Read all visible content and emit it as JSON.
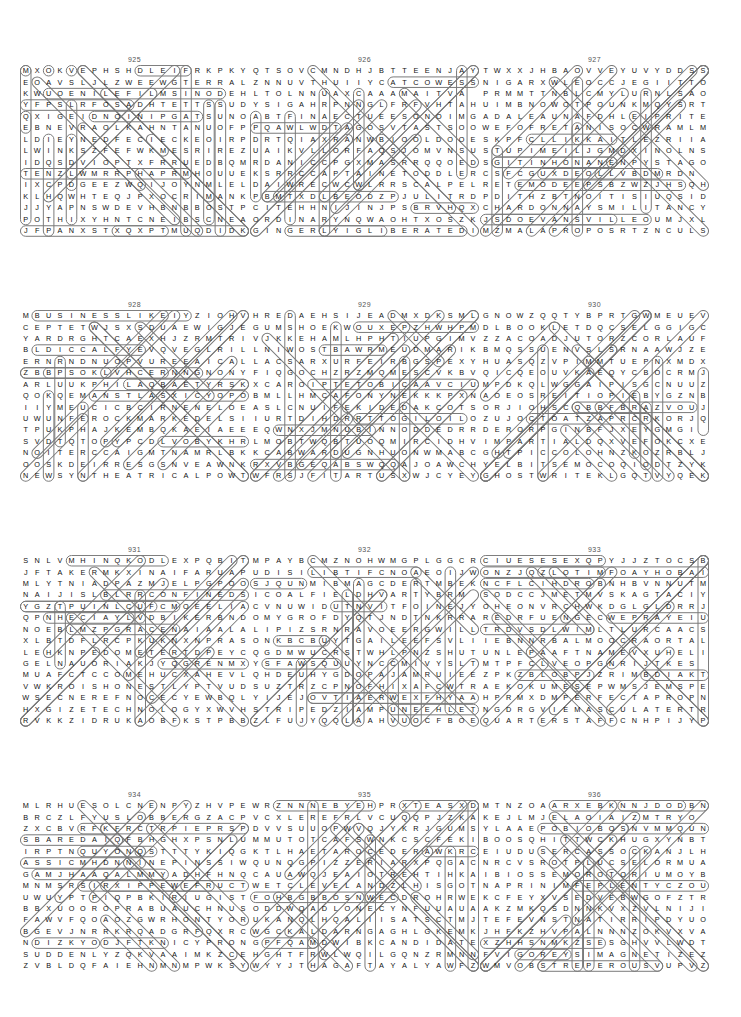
{
  "page": {
    "background_color": "#ffffff",
    "letter_color": "#111111",
    "mark_color": "#7a7a7a",
    "number_color": "#555555",
    "columns": 3,
    "rows": 4,
    "grid_size": 18
  },
  "puzzles": [
    {
      "number": "925",
      "grid": [
        "MXOKVEPHSHDLEIFRKPKY",
        "EOAVSLJLZWEEWGTERRAL",
        "KWUOENILEFILMSINODEH",
        "YFPSLRFOSADHTETTSSUD",
        "QXIGEIDNOINIPGATSUNO",
        "EBNEVRAOLKAHNTANUOFP",
        "LDIEYNEDFECIECKEOIRP",
        "LWINKSZFEFWKMESRIREZ",
        "IDQSDVIOPTXFRRUEDBQM",
        "TENZLWMRRPHAPRMHOUUE",
        "IXCPDGEEZWQIJOYNMLEL",
        "KLHQWHTEQJPXOCRIMANK",
        "JJYAPNSWDEVHBNBBOSTP",
        "POTHIXYHNTCNEIBSCNEA",
        "JFPANXSTXQXPTMUQDIDK"
      ],
      "solution_words": [
        "FILMS",
        "DIE",
        "FOUNTAIN",
        "CAPTION",
        "PINION",
        "CRIMINAL",
        "ODE"
      ]
    },
    {
      "number": "926",
      "grid": [
        "QTSOVCMNDHJBTTEENJAY",
        "ZNNUVTHUIIYCATCOWESS",
        "LTOLNNUAXCAAAMAITVA",
        "YSIGAHRPNNGLFRFVHTAH",
        "ABTFINAECTUEESONOIMG",
        "PQAWLWDTAGOSVTASTSOO",
        "DRTQIAXRANWBIOOLDOOE",
        "UAIKVLLORFAQSJOMVNSU",
        "RDANICCPGXMASRRQQOED",
        "KSRRCCAPTAINETODDLER",
        "DAIWRECWCWLRRSCALPEL",
        "PBMTXDLBEODZPJULITRD",
        "CITEHHNIJINJPSBRVHQX",
        "ORDINARYNQWAOHTXOSZK",
        "GINGERLYIGLIBERATEDI"
      ],
      "solution_words": [
        "CAPTAIN",
        "TODDLER",
        "SCALPEL",
        "ORDINARY",
        "GINGERLY",
        "LIBERATED",
        "TEEN"
      ]
    },
    {
      "number": "927",
      "grid": [
        "TWXXJHBAOVVEYUVYDDSS",
        "NIGARXWLEOCCJEGIITTO",
        "PRMMTTNBLCMYLURNLSAON",
        "UIMBNOWOTPOUNKMQYSRTE",
        "ADALEAUNAFDHLEIPRITEM",
        "WEFOFRETANISOCWRAMLMA",
        "SKPFCLLIKKAITLEZRIIAS",
        "STUPIMEILJGMDXINOLNSO",
        "SGITINHONANENPYSTAGOK",
        "CSFCGUXDEOLLVBDMRDN",
        "RETEMODEEPSBZWZJHSQH",
        "PDITHZBTNOITISIUQSID",
        "CHARDONNAYSMILITANCY",
        "JSDOEVANSVILLEOUMJXL",
        "MZMALAPROPOSRTZNCULS"
      ],
      "solution_words": [
        "SPEEDOMETER",
        "DISQUISITION",
        "CHARDONNAY",
        "MILITANCY",
        "EVANSVILLE",
        "MALAPROPOS"
      ]
    },
    {
      "number": "928",
      "grid": [
        "MBUSINESSLIKEIYZIOHV",
        "CEPTETWJSXSDUAEWIGJE",
        "YARDRGHTCAEXHJZRMTRI",
        "BLDICCALFYEVQVEGLRIL",
        "ERNRNDNUOPVUREEAICAL",
        "ZBBPSOKLVHCERNNGNONY",
        "ARLUUKPHILAQBAETYRSK",
        "QOKQEMANSTLASXICYOPO",
        "IIYMEUCICBCIRNENELOE",
        "UWUNFEROCKMARKEDELSI",
        "TPUKPHAJKEMBQKAEIAEE",
        "SVDTQTOPYPCDLVOBYKHR",
        "NOITERCCAIGMTNAMRLBK",
        "OOSKDEIRRESGSNVEAWNK",
        "NEWSYNTHEATRICALPOWT"
      ],
      "solution_words": [
        "BUSINESSLIKE",
        "STOCKMARKED",
        "ACCRETION",
        "SERRIED",
        "NEWSY",
        "THEATRICAL",
        "VERILY"
      ]
    },
    {
      "number": "929",
      "grid": [
        "HREDAEHSIJEADMXDKSML",
        "GUMSHOEKWOUXEPZHWHPM",
        "VJKKEHAMLHPHTIUPGIMV",
        "LNIWOSTBAWRMEUDMARIK",
        "LACSARXURFEIRBGSPEXY",
        "FIQGOCHZRZMQMESCVKBV",
        "XCAROIPTETOBICAAVCIU",
        "BMLLHMCAFONYNEKKKPXN",
        "ASLCNUIFEKIDEDAKCOTS",
        "IURTDIHDRRTTOGILOILO",
        "EQWNXJMNUBINNODDEDRR",
        "LMOBTWQBTUOQMIRCIDHV",
        "KCABWARDUGNHUONWMABC",
        "RXVBGEQABSWQQAJOAWCH",
        "WFRSJFITARTUSXWJCYEY"
      ],
      "solution_words": [
        "HEADER",
        "GUMSHOE",
        "RASCAL",
        "BRIEF",
        "STOCKADE",
        "ILOILO",
        "BACKWARD",
        "TARTUS"
      ]
    },
    {
      "number": "930",
      "grid": [
        "GNOWZQQTYBPRTGWMEUEV",
        "DLBOOKLETDQCSELGGIGC",
        "ZZACOADJUTORZCORLAUF",
        "BMQSSUENVSLSRNAAWJZE",
        "HUASQZVPIMMTUEPNXMDX",
        "QICQEOUVKAEQYCBOCRMJ",
        "MPDKQLWGGAIPISGCNUUZ",
        "AOEOSREITIOPIEBYGZNB",
        "ORJIOHSCQBBFBRAZVOUJ",
        "ZUJOCTOATZAPRCRKORJQ",
        "DERORPGINBFJXEYGMGI",
        "IMPARTIALDQXVEFOKCXE",
        "GHTPICCOLOHNZKOZRBLJ",
        "YELBITSEMOCOQIODTZYK",
        "GHOSTWRITEKLGQTVYQEK"
      ],
      "solution_words": [
        "BOOKLET",
        "COADJUTOR",
        "GIGGLE",
        "SUENS",
        "POITIERS",
        "IMPARTIAL",
        "PICCOLO",
        "COMESTIBLEY",
        "GHOSTWRITE"
      ]
    },
    {
      "number": "931",
      "grid": [
        "SNLVMHINQKODLEXPQBIT",
        "JFTAKERMKXINAIFARUAP",
        "MLYTNIADPAZMJELPGPOO",
        "NAIJISLBLRRCONFINEDS",
        "YGZTPUINLCUFCMOEELIA",
        "QPNHECIAYLVDBIKERBND",
        "NOEBLMZPGRACENAIAALA",
        "XLBTDFLRCPKUKNXNPRAS",
        "LEHKNPEDOMETERTDPEYC",
        "GELNAUORIAKJYQGRENMX",
        "MUAFCTCCOMEHUCXAHEVL",
        "VWKROISHONESTLYPTVUD",
        "WSECNEREFNOCECYEWBQL",
        "HXGIZETECHNOLOGYXWVH",
        "RVKKZIDRUKAOBFKSTPBB"
      ],
      "solution_words": [
        "CONFINED",
        "PEDOMETER",
        "ARIOUAN",
        "HONESTLY",
        "CONFERENCE",
        "TECHNOLOGY",
        "BIKER"
      ]
    },
    {
      "number": "932",
      "grid": [
        "MPAYBCMZNOHWMGPLGGCR",
        "UDISILIBTIFCNOAEOIJW",
        "SJQUNMIBMAGCDERTMBEK",
        "ICOALFIELDHVARTYBRM",
        "CVNUWIDUTNVITFOINEJY",
        "OMYGROFDYQTJNDTNKRRA",
        "LIPIZSRNRAVOEERGWILL",
        "ONKBCBUYTGAILEEFSVLI",
        "QGDMWUCRSTWHLPNZSHUT",
        "YSFAWSQUUYNCCMIVYSLT",
        "QHDEUHYGDOPAJAMRUIEE",
        "SUZTRZCPNOFHIXAFCWTR",
        "YIJEJOVTIAERWEXFHYAA",
        "STRIPEDZIAMPUNEEHLET",
        "ZLFUJYQQLAAHVUOCFBOE"
      ],
      "solution_words": [
        "COALFIELD",
        "ISILIBT",
        "STRIPED",
        "PAJAM",
        "GIGGLE"
      ]
    },
    {
      "number": "933",
      "grid": [
        "CIUESESEXQPYJJZTOCSB",
        "ONZJQZLOTIMFOAYHOBAI",
        "NCFLCIHDROBNHBVNNUTM",
        "SODCCJMETMVSKAGTACIY",
        "OHEONVRCHWKDGLGLDRRJ",
        "REDRFUENGECWEPRAYEIU",
        "TRDVSDLWIMLTLURCAACS",
        "IEBNNRBALMOOCRAORTAL",
        "UNLEPAAFTNAMEVXUHELI",
        "MTPFCLVEOPGNRIJTKES",
        "ZPKZBLOBPJZRIMBDIAKT",
        "AEKOKUMESEPWMSJEMSPE",
        "HPRMXDMPERFECTAPROPN",
        "NGDRGVIEMASCULATERTR",
        "QUARTERSTAFFCNHPIJYP"
      ],
      "solution_words": [
        "PERFECTA",
        "EMASCULATER",
        "QUARTERSTAFF",
        "PRAYER",
        "NAME"
      ]
    },
    {
      "number": "934",
      "grid": [
        "MLRHUESOLCNENPYZHVPE",
        "BRCZLFYUSLOBBERGZACP",
        "ZXCBVRFKFRCTRPIEPRSP",
        "SBAREDAIQFBHGHXPSNLU",
        "IRPTNQUYONQSTTTYKIQG",
        "ASSICMHDNNINEPINSSIW",
        "GAMJHAAQALMMYADHFHNQ",
        "MNMSRSIRXIPPEWEFRUCT",
        "UWUYPTPIQPBKIRIUGIST",
        "BBXUOOROPRABUAUCHNUS",
        "FAWVFQOAOZGWRHONTYOR",
        "BGEVJNRRKRQADGRFQXRC",
        "NDIZKYODJFTKNICYPRON",
        "SUDDENLYZQKVAAIMKZCE",
        "ZVBLDQFAIEHNMNMPWKSY"
      ],
      "solution_words": [
        "CLOSE",
        "SLOBBER",
        "NINEPINS",
        "SUDDENLY",
        "IRIGUIS"
      ]
    },
    {
      "number": "935",
      "grid": [
        "WRZNNNEBYEHPRXTEASXD",
        "VCXLEREFRLVCUQQPJZKAE",
        "DVVSUUOPWVQJYKRJGUMS",
        "MMUTOTCAFSWNKCSCFEKI",
        "KTLHAETAROCEDERAWKRC",
        "QUNQGPIZZERIARXPQGAC",
        "CAUAWQJEAIOTREHTIHKA",
        "WETCLEVELANDZLHISGOT",
        "FOHBGBBOSNWECDROHRWE",
        "ODDWQADLONECYNFUUAUA",
        "UKANQLHQALIISATSCTMJ",
        "WGCKALDARNGAGHLGKEMK",
        "GPFQAMDWIBKCANDIDATE",
        "HGHTFRWLWQILGQNZRMNN",
        "WYYJTHAGAFTAYALYAWFZ"
      ],
      "solution_words": [
        "FACTOTUM",
        "REDECORATE",
        "PIZZERIA",
        "THERTO",
        "CLEVELAND",
        "CANDIDATE",
        "WAYLAY"
      ]
    },
    {
      "number": "936",
      "grid": [
        "MTNZOAARXEBKNNJDODBN",
        "KEJLMJELAOIAIZMTRYO",
        "YLAAEPOBIOBOSNVMMQUN",
        "BOOSQHITTWCKHUGXYNBT",
        "EIUDUSERCASSOCKANJLH",
        "NRCVSROTPLUCSELORMUA",
        "IBIOSSEMOROTORIUMOYB",
        "NAPRINIMFEPLENTYCZOU",
        "KCFEYXVSEDVEBWGOFZTR",
        "AKZMKQSDNNKVXZVLNIJI",
        "TEFEVNSTNATIRRIPDYUO",
        "JHFKZHVPALNNNZOKVXVA",
        "XZHHSNMKZSESGHVVLWDT",
        "FVIGOREYSIMAGNETIZEZ",
        "WMVOBSTREPEROUSVUPVZ"
      ],
      "solution_words": [
        "CASSOCK",
        "SCULPTOR",
        "MORATORIUM",
        "PLENTY",
        "IRRITANT",
        "VIGOR",
        "MAGNETIZE",
        "OBSTREPEROUS"
      ]
    }
  ],
  "marks": {
    "925": [
      {
        "r1": 0,
        "c1": 0,
        "r2": 0,
        "c2": 0
      },
      {
        "r1": 0,
        "c1": 2,
        "r2": 0,
        "c2": 2
      },
      {
        "r1": 0,
        "c1": 4,
        "r2": 0,
        "c2": 4
      },
      {
        "r1": 0,
        "c1": 10,
        "r2": 0,
        "c2": 14
      },
      {
        "r1": 2,
        "c1": 2,
        "r2": 2,
        "c2": 17
      },
      {
        "r1": 4,
        "c1": 6,
        "r2": 4,
        "c2": 15
      },
      {
        "r1": 0,
        "c1": 0,
        "r2": 5,
        "c2": 0
      },
      {
        "r1": 4,
        "c1": 0,
        "r2": 13,
        "c2": 0
      },
      {
        "r1": 0,
        "c1": 14,
        "r2": 14,
        "c2": 14
      },
      {
        "r1": 3,
        "c1": 16,
        "r2": 13,
        "c2": 16
      },
      {
        "r1": 3,
        "c1": 17,
        "r2": 14,
        "c2": 17
      },
      {
        "r1": 6,
        "c1": 4,
        "r2": 13,
        "c2": 4
      },
      {
        "r1": 0,
        "c1": 5,
        "r2": 7,
        "c2": 12
      },
      {
        "r1": 0,
        "c1": 13,
        "r2": 9,
        "c2": 4
      },
      {
        "r1": 1,
        "c1": 1,
        "r2": 10,
        "c2": 10
      },
      {
        "r1": 2,
        "c1": 11,
        "r2": 11,
        "c2": 2
      },
      {
        "r1": 5,
        "c1": 5,
        "r2": 13,
        "c2": 13
      }
    ]
  }
}
